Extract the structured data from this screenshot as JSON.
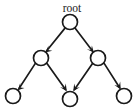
{
  "diagram": {
    "type": "directed-acyclic-graph",
    "title": "root",
    "background_color": "#ffffff",
    "stroke_color": "#1a1a1a",
    "node_fill_color": "#ffffff",
    "labels": {
      "root": "root"
    },
    "nodes": [
      {
        "id": "root",
        "label": "root",
        "cx": 70,
        "cy": 22,
        "r": 7.5,
        "level": 0,
        "has_label": true
      },
      {
        "id": "m1",
        "label": "",
        "cx": 41,
        "cy": 58,
        "r": 7.5,
        "level": 1,
        "has_label": false
      },
      {
        "id": "m2",
        "label": "",
        "cx": 98,
        "cy": 58,
        "r": 7.5,
        "level": 1,
        "has_label": false
      },
      {
        "id": "b1",
        "label": "",
        "cx": 13,
        "cy": 96,
        "r": 7.5,
        "level": 2,
        "has_label": false
      },
      {
        "id": "b2",
        "label": "",
        "cx": 70,
        "cy": 99,
        "r": 7.5,
        "level": 2,
        "has_label": false
      },
      {
        "id": "b3",
        "label": "",
        "cx": 124,
        "cy": 96,
        "r": 7.5,
        "level": 2,
        "has_label": false
      }
    ],
    "edges": [
      {
        "id": "e1",
        "from": "root",
        "to": "m1",
        "directed": true
      },
      {
        "id": "e2",
        "from": "root",
        "to": "m2",
        "directed": true
      },
      {
        "id": "e3",
        "from": "m1",
        "to": "b1",
        "directed": true
      },
      {
        "id": "e4",
        "from": "m1",
        "to": "b2",
        "directed": true
      },
      {
        "id": "e5",
        "from": "m2",
        "to": "b2",
        "directed": true
      },
      {
        "id": "e6",
        "from": "m2",
        "to": "b3",
        "directed": true
      }
    ]
  }
}
